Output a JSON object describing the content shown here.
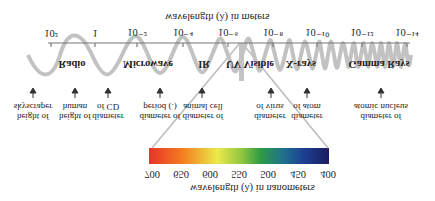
{
  "title_nm": "wavelength (λ) in nanometers",
  "title_m": "wavelength (λ) in meters",
  "nm_ticks": [
    {
      "label": "400",
      "x": 328
    },
    {
      "label": "450",
      "x": 298
    },
    {
      "label": "500",
      "x": 268
    },
    {
      "label": "550",
      "x": 239
    },
    {
      "label": "600",
      "x": 210
    },
    {
      "label": "650",
      "x": 181
    },
    {
      "label": "700",
      "x": 152
    }
  ],
  "m_ticks": [
    {
      "label": "10²",
      "x": 51
    },
    {
      "label": "1",
      "x": 95
    },
    {
      "label": "10⁻²",
      "x": 137
    },
    {
      "label": "10⁻⁴",
      "x": 183
    },
    {
      "label": "10⁻⁶",
      "x": 228
    },
    {
      "label": "10⁻⁸",
      "x": 273
    },
    {
      "label": "10⁻¹⁰",
      "x": 317
    },
    {
      "label": "10⁻¹²",
      "x": 362
    },
    {
      "label": "10⁻¹⁴",
      "x": 407
    }
  ],
  "bands": [
    {
      "label": "Radio",
      "x": 72
    },
    {
      "label": "Microwave",
      "x": 148
    },
    {
      "label": "IR",
      "x": 204
    },
    {
      "label": "UV Visible",
      "x": 250
    },
    {
      "label": "X-rays",
      "x": 301
    },
    {
      "label": "Gamma Rays",
      "x": 379
    }
  ],
  "examples": [
    {
      "line1": "height of",
      "line2": "skyscraper",
      "x": 33
    },
    {
      "line1": "height of",
      "line2": "human",
      "x": 75
    },
    {
      "line1": "diameter",
      "line2": "of CD",
      "x": 108
    },
    {
      "line1": "diameter of",
      "line2": "period (.)",
      "x": 160
    },
    {
      "line1": "diameter of",
      "line2": "animal cell",
      "x": 203
    },
    {
      "line1": "diameter",
      "line2": "of virus",
      "x": 270
    },
    {
      "line1": "diameter",
      "line2": "of atom",
      "x": 307
    },
    {
      "line1": "diameter of",
      "line2": "atomic nucleus",
      "x": 381
    }
  ],
  "spectrum_colors": [
    "#e8322a",
    "#f47b20",
    "#f7c52a",
    "#ece94a",
    "#8cc43f",
    "#2f9b45",
    "#1f6f8f",
    "#1c3f92",
    "#1c1c5c"
  ]
}
